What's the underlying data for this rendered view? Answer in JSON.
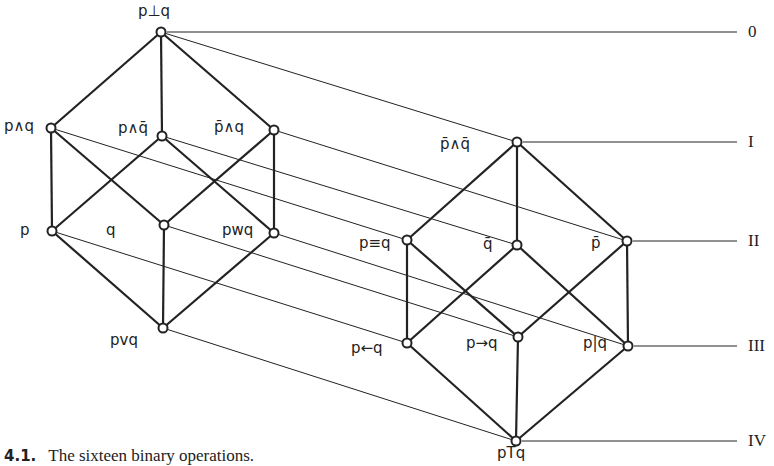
{
  "caption": {
    "number": "4.1.",
    "text": "The sixteen binary operations."
  },
  "colors": {
    "stroke": "#222222",
    "background": "#ffffff"
  },
  "levels": [
    {
      "label": "0",
      "y": 32
    },
    {
      "label": "I",
      "y": 142
    },
    {
      "label": "II",
      "y": 241
    },
    {
      "label": "III",
      "y": 346
    },
    {
      "label": "IV",
      "y": 441
    }
  ],
  "left_lattice": {
    "nodes": [
      {
        "id": "p_bot_q",
        "label": "p⊥q",
        "x": 161,
        "y": 32,
        "lx": 138,
        "ly": 4
      },
      {
        "id": "p_and_q",
        "label": "p∧q",
        "x": 51,
        "y": 128,
        "lx": 4,
        "ly": 119
      },
      {
        "id": "p_and_nq",
        "label": "p∧q̄",
        "x": 162,
        "y": 136,
        "lx": 118,
        "ly": 121
      },
      {
        "id": "np_and_q",
        "label": "p̄∧q",
        "x": 274,
        "y": 130,
        "lx": 214,
        "ly": 120
      },
      {
        "id": "p",
        "label": "p",
        "x": 52,
        "y": 231,
        "lx": 20,
        "ly": 223
      },
      {
        "id": "q",
        "label": "q",
        "x": 164,
        "y": 225,
        "lx": 106,
        "ly": 223
      },
      {
        "id": "p_xor_q",
        "label": "pwq",
        "x": 274,
        "y": 233,
        "lx": 222,
        "ly": 223
      },
      {
        "id": "p_or_q",
        "label": "pvq",
        "x": 163,
        "y": 328,
        "lx": 110,
        "ly": 333
      }
    ]
  },
  "right_lattice": {
    "nodes": [
      {
        "id": "np_and_nq",
        "label": "p̄∧q̄",
        "x": 517,
        "y": 142,
        "lx": 440,
        "ly": 137
      },
      {
        "id": "p_eq_q",
        "label": "p≡q",
        "x": 407,
        "y": 240,
        "lx": 359,
        "ly": 236
      },
      {
        "id": "nq",
        "label": "q̄",
        "x": 517,
        "y": 245,
        "lx": 483,
        "ly": 237
      },
      {
        "id": "np",
        "label": "p̄",
        "x": 627,
        "y": 241,
        "lx": 591,
        "ly": 236
      },
      {
        "id": "p_from_q",
        "label": "p←q",
        "x": 407,
        "y": 343,
        "lx": 351,
        "ly": 341
      },
      {
        "id": "p_to_q",
        "label": "p→q",
        "x": 518,
        "y": 337,
        "lx": 466,
        "ly": 336
      },
      {
        "id": "p_nand_q",
        "label": "p|q",
        "x": 628,
        "y": 346,
        "lx": 583,
        "ly": 336
      },
      {
        "id": "p_top_q",
        "label": "pTq",
        "x": 516,
        "y": 441,
        "lx": 497,
        "ly": 446
      }
    ]
  },
  "correspondences": [
    [
      "p_bot_q",
      "np_and_nq"
    ],
    [
      "p_and_q",
      "p_eq_q"
    ],
    [
      "p_and_nq",
      "nq"
    ],
    [
      "np_and_q",
      "np"
    ],
    [
      "p",
      "p_from_q"
    ],
    [
      "q",
      "p_to_q"
    ],
    [
      "p_xor_q",
      "p_nand_q"
    ],
    [
      "p_or_q",
      "p_top_q"
    ]
  ]
}
